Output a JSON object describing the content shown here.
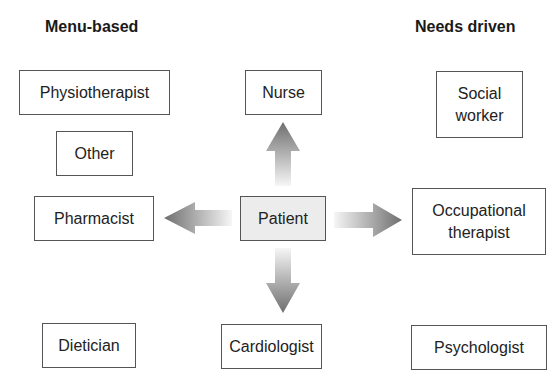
{
  "headings": {
    "left": "Menu-based",
    "right": "Needs driven"
  },
  "center": {
    "label": "Patient",
    "fill": "#ececec"
  },
  "left_column": [
    {
      "label": "Physiotherapist"
    },
    {
      "label": "Other"
    },
    {
      "label": "Pharmacist"
    },
    {
      "label": "Dietician"
    }
  ],
  "middle_column": [
    {
      "label": "Nurse"
    },
    {
      "label": "Cardiologist"
    }
  ],
  "right_column": [
    {
      "label_line1": "Social",
      "label_line2": "worker"
    },
    {
      "label_line1": "Occupational",
      "label_line2": "therapist"
    },
    {
      "label": "Psychologist"
    }
  ],
  "arrows": [
    {
      "direction": "up",
      "from": "Patient",
      "to": "Nurse"
    },
    {
      "direction": "left",
      "from": "Patient",
      "to": "Pharmacist"
    },
    {
      "direction": "right",
      "from": "Patient",
      "to": "Occupational therapist"
    },
    {
      "direction": "down",
      "from": "Patient",
      "to": "Cardiologist"
    }
  ],
  "colors": {
    "box_border": "#555555",
    "arrow_dark": "#6e6e6e",
    "arrow_light": "#f4f4f4",
    "text": "#222222"
  }
}
